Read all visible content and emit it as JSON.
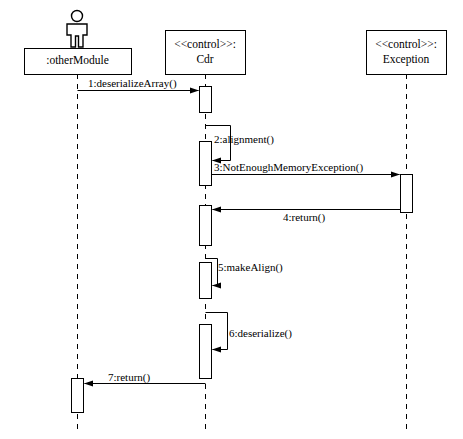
{
  "diagram": {
    "type": "uml-sequence-diagram",
    "title": "",
    "width": 463,
    "height": 439,
    "stroke_color": "#000000",
    "background_color": "#ffffff"
  },
  "lifelines": [
    {
      "id": "otherModule",
      "name": ":otherModule",
      "stereotype": "",
      "has_actor_figure": true,
      "actor_icon": "actor-stick-figure-icon",
      "box": {
        "x": 24,
        "y": 48,
        "w": 107,
        "h": 26
      },
      "axis_x": 77,
      "line_top": 74,
      "line_bottom": 432
    },
    {
      "id": "cdr",
      "name": "Cdr",
      "stereotype": "<<control>>:",
      "has_actor_figure": false,
      "actor_icon": "",
      "box": {
        "x": 165,
        "y": 30,
        "w": 80,
        "h": 44
      },
      "axis_x": 205,
      "line_top": 74,
      "line_bottom": 432
    },
    {
      "id": "exception",
      "name": "Exception",
      "stereotype": "<<control>>:",
      "has_actor_figure": false,
      "actor_icon": "",
      "box": {
        "x": 366,
        "y": 30,
        "w": 80,
        "h": 44
      },
      "axis_x": 406,
      "line_top": 74,
      "line_bottom": 432
    }
  ],
  "activations": [
    {
      "id": "act-cdr-1",
      "lifeline": "cdr",
      "x": 199,
      "y": 86,
      "w": 12,
      "h": 26
    },
    {
      "id": "act-cdr-2",
      "lifeline": "cdr",
      "x": 199,
      "y": 141,
      "w": 12,
      "h": 44
    },
    {
      "id": "act-exc-1",
      "lifeline": "exception",
      "x": 400,
      "y": 174,
      "w": 12,
      "h": 38
    },
    {
      "id": "act-cdr-3",
      "lifeline": "cdr",
      "x": 199,
      "y": 205,
      "w": 12,
      "h": 40
    },
    {
      "id": "act-cdr-4",
      "lifeline": "cdr",
      "x": 199,
      "y": 262,
      "w": 12,
      "h": 36
    },
    {
      "id": "act-cdr-5",
      "lifeline": "cdr",
      "x": 199,
      "y": 324,
      "w": 12,
      "h": 54
    },
    {
      "id": "act-other-1",
      "lifeline": "otherModule",
      "x": 71,
      "y": 378,
      "w": 12,
      "h": 34
    }
  ],
  "messages": [
    {
      "seq": "1",
      "label": "1:deserializeArray()",
      "from": "otherModule",
      "to": "cdr",
      "kind": "call",
      "self": false,
      "arrow_y": 90,
      "x_from": 77,
      "x_to": 198,
      "label_x": 88,
      "label_y": 78
    },
    {
      "seq": "2",
      "label": "2:alignment()",
      "from": "cdr",
      "to": "cdr",
      "kind": "self-call",
      "self": true,
      "arrow_y": 160,
      "top_y": 125,
      "out_x": 230,
      "x_from": 205,
      "x_to": 212,
      "label_x": 214,
      "label_y": 134
    },
    {
      "seq": "3",
      "label": "3:NotEnoughMemoryException()",
      "from": "cdr",
      "to": "exception",
      "kind": "call",
      "self": false,
      "arrow_y": 174,
      "x_from": 211,
      "x_to": 399,
      "label_x": 214,
      "label_y": 162
    },
    {
      "seq": "4",
      "label": "4:return()",
      "from": "exception",
      "to": "cdr",
      "kind": "return",
      "self": false,
      "arrow_y": 209,
      "x_from": 400,
      "x_to": 212,
      "label_x": 283,
      "label_y": 212
    },
    {
      "seq": "5",
      "label": "5:makeAlign()",
      "from": "cdr",
      "to": "cdr",
      "kind": "self-call",
      "self": true,
      "arrow_y": 285,
      "top_y": 258,
      "out_x": 217,
      "x_from": 205,
      "x_to": 212,
      "label_x": 218,
      "label_y": 262
    },
    {
      "seq": "6",
      "label": "6:deserialize()",
      "from": "cdr",
      "to": "cdr",
      "kind": "self-call",
      "self": true,
      "arrow_y": 349,
      "top_y": 312,
      "out_x": 227,
      "x_from": 205,
      "x_to": 212,
      "label_x": 229,
      "label_y": 328
    },
    {
      "seq": "7",
      "label": "7:return()",
      "from": "cdr",
      "to": "otherModule",
      "kind": "return",
      "self": false,
      "arrow_y": 383,
      "x_from": 205,
      "x_to": 84,
      "label_x": 108,
      "label_y": 372
    }
  ]
}
